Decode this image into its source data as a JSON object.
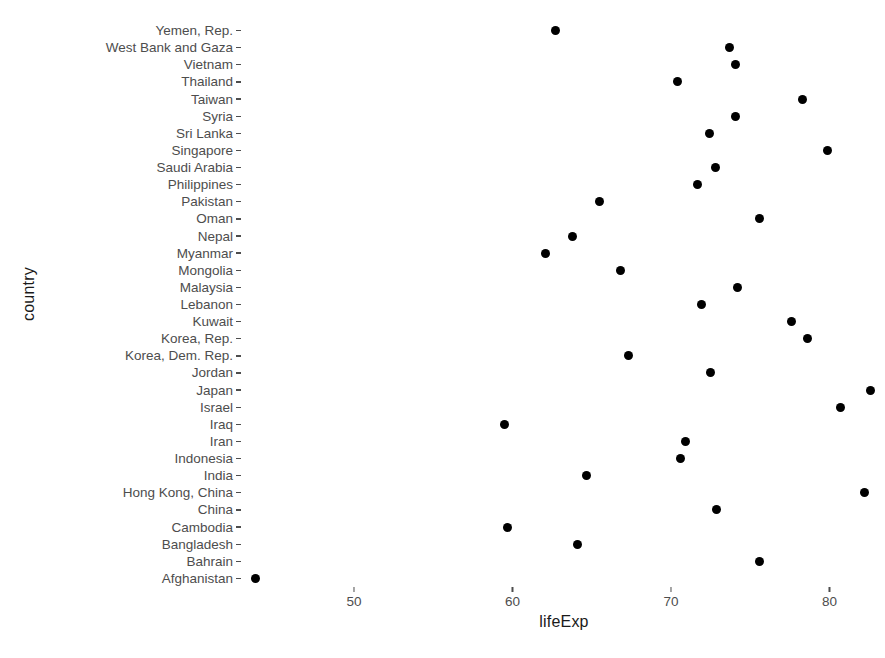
{
  "chart_data": {
    "type": "scatter",
    "title": "",
    "xlabel": "lifeExp",
    "ylabel": "country",
    "grid": false,
    "legend": null,
    "xlim": [
      43.0,
      83.5
    ],
    "x_ticks": [
      50,
      60,
      70,
      80
    ],
    "x_tick_labels": [
      "50",
      "60",
      "70",
      "80"
    ],
    "categories": [
      "Yemen, Rep.",
      "West Bank and Gaza",
      "Vietnam",
      "Thailand",
      "Taiwan",
      "Syria",
      "Sri Lanka",
      "Singapore",
      "Saudi Arabia",
      "Philippines",
      "Pakistan",
      "Oman",
      "Nepal",
      "Myanmar",
      "Mongolia",
      "Malaysia",
      "Lebanon",
      "Kuwait",
      "Korea, Rep.",
      "Korea, Dem. Rep.",
      "Jordan",
      "Japan",
      "Israel",
      "Iraq",
      "Iran",
      "Indonesia",
      "India",
      "Hong Kong, China",
      "China",
      "Cambodia",
      "Bangladesh",
      "Bahrain",
      "Afghanistan"
    ],
    "points": [
      {
        "country": "Yemen, Rep.",
        "lifeExp": 62.7
      },
      {
        "country": "West Bank and Gaza",
        "lifeExp": 73.7
      },
      {
        "country": "Vietnam",
        "lifeExp": 74.1
      },
      {
        "country": "Thailand",
        "lifeExp": 70.4
      },
      {
        "country": "Taiwan",
        "lifeExp": 78.3
      },
      {
        "country": "Syria",
        "lifeExp": 74.1
      },
      {
        "country": "Sri Lanka",
        "lifeExp": 72.4
      },
      {
        "country": "Singapore",
        "lifeExp": 79.9
      },
      {
        "country": "Saudi Arabia",
        "lifeExp": 72.8
      },
      {
        "country": "Philippines",
        "lifeExp": 71.7
      },
      {
        "country": "Pakistan",
        "lifeExp": 65.5
      },
      {
        "country": "Oman",
        "lifeExp": 75.6
      },
      {
        "country": "Nepal",
        "lifeExp": 63.8
      },
      {
        "country": "Myanmar",
        "lifeExp": 62.1
      },
      {
        "country": "Mongolia",
        "lifeExp": 66.8
      },
      {
        "country": "Malaysia",
        "lifeExp": 74.2
      },
      {
        "country": "Lebanon",
        "lifeExp": 71.9
      },
      {
        "country": "Kuwait",
        "lifeExp": 77.6
      },
      {
        "country": "Korea, Rep.",
        "lifeExp": 78.6
      },
      {
        "country": "Korea, Dem. Rep.",
        "lifeExp": 67.3
      },
      {
        "country": "Jordan",
        "lifeExp": 72.5
      },
      {
        "country": "Japan",
        "lifeExp": 82.6
      },
      {
        "country": "Israel",
        "lifeExp": 80.7
      },
      {
        "country": "Iraq",
        "lifeExp": 59.5
      },
      {
        "country": "Iran",
        "lifeExp": 70.9
      },
      {
        "country": "Indonesia",
        "lifeExp": 70.6
      },
      {
        "country": "India",
        "lifeExp": 64.7
      },
      {
        "country": "Hong Kong, China",
        "lifeExp": 82.2
      },
      {
        "country": "China",
        "lifeExp": 72.9
      },
      {
        "country": "Cambodia",
        "lifeExp": 59.7
      },
      {
        "country": "Bangladesh",
        "lifeExp": 64.1
      },
      {
        "country": "Bahrain",
        "lifeExp": 75.6
      },
      {
        "country": "Afghanistan",
        "lifeExp": 43.8
      }
    ]
  }
}
